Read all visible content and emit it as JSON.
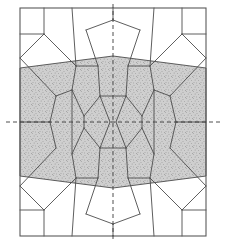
{
  "figure": {
    "title": "",
    "caption": "",
    "type": "cellular-tessellation-diagram",
    "background_color": "#ffffff",
    "line_color": "#4c4c4c",
    "frame_color": "#595959",
    "shade_fill": "#cfcfcf",
    "speckle_color": "#6e6e6e",
    "axis_color": "#3a3a3a",
    "line_width": 0.9,
    "frame_width": 1.1,
    "canvas": {
      "width": 226,
      "height": 252
    }
  },
  "frame": {
    "label": "outer-rectangle",
    "x0": 20,
    "y0": 8,
    "x1": 206,
    "y1": 236
  },
  "symmetry_axes": {
    "vertical": {
      "label": "vertical-mirror-axis",
      "x": 113,
      "y0": 4,
      "y1": 242,
      "dash": "4 3"
    },
    "horizontal": {
      "label": "horizontal-mirror-axis",
      "y": 122,
      "x0": 6,
      "x1": 220,
      "dash": "4 3"
    }
  },
  "shaded_band": {
    "label": "stippled-band",
    "top_edge": [
      [
        20,
        68
      ],
      [
        113,
        56
      ],
      [
        206,
        68
      ]
    ],
    "bottom_edge": [
      [
        206,
        176
      ],
      [
        113,
        188
      ],
      [
        20,
        176
      ]
    ],
    "fill": "#cfcfcf",
    "speckle_density": 0.33
  },
  "cell_edges": [
    {
      "name": "top-frame-vertex-left",
      "points": [
        [
          20,
          34
        ],
        [
          44,
          34
        ]
      ]
    },
    {
      "name": "top-stub-left",
      "points": [
        [
          44,
          8
        ],
        [
          44,
          34
        ]
      ]
    },
    {
      "name": "top-cell-left-diag",
      "points": [
        [
          44,
          34
        ],
        [
          76,
          66
        ]
      ]
    },
    {
      "name": "top-left-to-trapezoid",
      "points": [
        [
          76,
          66
        ],
        [
          72,
          8
        ]
      ]
    },
    {
      "name": "top-left-small-lower",
      "points": [
        [
          20,
          58
        ],
        [
          44,
          34
        ]
      ]
    },
    {
      "name": "left-upper-cell",
      "points": [
        [
          20,
          58
        ],
        [
          56,
          96
        ]
      ]
    },
    {
      "name": "node-top-left-a",
      "points": [
        [
          76,
          66
        ],
        [
          98,
          66
        ]
      ]
    },
    {
      "name": "node-top-left-b",
      "points": [
        [
          76,
          66
        ],
        [
          72,
          90
        ]
      ]
    },
    {
      "name": "decagon-upper-left",
      "points": [
        [
          98,
          66
        ],
        [
          86,
          30
        ]
      ]
    },
    {
      "name": "decagon-top-left-edge",
      "points": [
        [
          86,
          30
        ],
        [
          113,
          20
        ]
      ]
    },
    {
      "name": "decagon-seam-top",
      "points": [
        [
          113,
          8
        ],
        [
          113,
          20
        ]
      ]
    },
    {
      "name": "decagon-upper-right",
      "points": [
        [
          128,
          66
        ],
        [
          140,
          30
        ]
      ]
    },
    {
      "name": "decagon-top-right-edge",
      "points": [
        [
          140,
          30
        ],
        [
          113,
          20
        ]
      ]
    },
    {
      "name": "node-top-right-a",
      "points": [
        [
          150,
          66
        ],
        [
          128,
          66
        ]
      ]
    },
    {
      "name": "node-top-right-b",
      "points": [
        [
          150,
          66
        ],
        [
          154,
          90
        ]
      ]
    },
    {
      "name": "top-right-to-trapezoid",
      "points": [
        [
          150,
          66
        ],
        [
          154,
          8
        ]
      ]
    },
    {
      "name": "top-cell-right-diag",
      "points": [
        [
          182,
          34
        ],
        [
          150,
          66
        ]
      ]
    },
    {
      "name": "top-stub-right",
      "points": [
        [
          182,
          8
        ],
        [
          182,
          34
        ]
      ]
    },
    {
      "name": "top-frame-vertex-right",
      "points": [
        [
          206,
          34
        ],
        [
          182,
          34
        ]
      ]
    },
    {
      "name": "top-right-small-lower",
      "points": [
        [
          206,
          58
        ],
        [
          182,
          34
        ]
      ]
    },
    {
      "name": "right-upper-cell",
      "points": [
        [
          206,
          58
        ],
        [
          170,
          96
        ]
      ]
    },
    {
      "name": "mid-left-pocket-top",
      "points": [
        [
          56,
          96
        ],
        [
          72,
          90
        ]
      ]
    },
    {
      "name": "mid-left-pocket-side",
      "points": [
        [
          56,
          96
        ],
        [
          50,
          122
        ]
      ]
    },
    {
      "name": "mid-left-frame-edge",
      "points": [
        [
          20,
          122
        ],
        [
          50,
          122
        ]
      ]
    },
    {
      "name": "mid-left-pocket-bot",
      "points": [
        [
          50,
          122
        ],
        [
          56,
          148
        ]
      ]
    },
    {
      "name": "left-lower-cell",
      "points": [
        [
          20,
          186
        ],
        [
          56,
          148
        ]
      ]
    },
    {
      "name": "mid-right-pocket-top",
      "points": [
        [
          170,
          96
        ],
        [
          154,
          90
        ]
      ]
    },
    {
      "name": "mid-right-pocket-side",
      "points": [
        [
          170,
          96
        ],
        [
          176,
          122
        ]
      ]
    },
    {
      "name": "mid-right-frame-edge",
      "points": [
        [
          206,
          122
        ],
        [
          176,
          122
        ]
      ]
    },
    {
      "name": "mid-right-pocket-bot",
      "points": [
        [
          176,
          122
        ],
        [
          170,
          148
        ]
      ]
    },
    {
      "name": "right-lower-cell",
      "points": [
        [
          206,
          186
        ],
        [
          170,
          148
        ]
      ]
    },
    {
      "name": "inner-left-upper",
      "points": [
        [
          72,
          90
        ],
        [
          84,
          116
        ]
      ]
    },
    {
      "name": "inner-left-lower",
      "points": [
        [
          72,
          154
        ],
        [
          84,
          128
        ]
      ]
    },
    {
      "name": "inner-left-side",
      "points": [
        [
          72,
          90
        ],
        [
          72,
          154
        ]
      ]
    },
    {
      "name": "inner-right-upper",
      "points": [
        [
          154,
          90
        ],
        [
          142,
          116
        ]
      ]
    },
    {
      "name": "inner-right-lower",
      "points": [
        [
          154,
          154
        ],
        [
          142,
          128
        ]
      ]
    },
    {
      "name": "inner-right-side",
      "points": [
        [
          154,
          90
        ],
        [
          154,
          154
        ]
      ]
    },
    {
      "name": "bowtie-top-bar",
      "points": [
        [
          100,
          96
        ],
        [
          126,
          96
        ]
      ]
    },
    {
      "name": "bowtie-top-left",
      "points": [
        [
          100,
          96
        ],
        [
          110,
          122
        ]
      ]
    },
    {
      "name": "bowtie-top-right",
      "points": [
        [
          126,
          96
        ],
        [
          116,
          122
        ]
      ]
    },
    {
      "name": "bowtie-bot-left",
      "points": [
        [
          110,
          122
        ],
        [
          100,
          148
        ]
      ]
    },
    {
      "name": "bowtie-bot-right",
      "points": [
        [
          116,
          122
        ],
        [
          126,
          148
        ]
      ]
    },
    {
      "name": "bowtie-bot-bar",
      "points": [
        [
          100,
          148
        ],
        [
          126,
          148
        ]
      ]
    },
    {
      "name": "center-left-octagon-tl",
      "points": [
        [
          100,
          96
        ],
        [
          84,
          116
        ]
      ]
    },
    {
      "name": "center-left-octagon-bl",
      "points": [
        [
          100,
          148
        ],
        [
          84,
          128
        ]
      ]
    },
    {
      "name": "center-left-octagon-sp",
      "points": [
        [
          84,
          116
        ],
        [
          84,
          128
        ]
      ]
    },
    {
      "name": "center-right-octagon-tr",
      "points": [
        [
          126,
          96
        ],
        [
          142,
          116
        ]
      ]
    },
    {
      "name": "center-right-octagon-br",
      "points": [
        [
          126,
          148
        ],
        [
          142,
          128
        ]
      ]
    },
    {
      "name": "center-right-octagon-sp",
      "points": [
        [
          142,
          116
        ],
        [
          142,
          128
        ]
      ]
    },
    {
      "name": "upper-left-oct-top",
      "points": [
        [
          98,
          66
        ],
        [
          100,
          96
        ]
      ]
    },
    {
      "name": "upper-right-oct-top",
      "points": [
        [
          128,
          66
        ],
        [
          126,
          96
        ]
      ]
    },
    {
      "name": "lower-left-oct-bot",
      "points": [
        [
          98,
          178
        ],
        [
          100,
          148
        ]
      ]
    },
    {
      "name": "lower-right-oct-bot",
      "points": [
        [
          128,
          178
        ],
        [
          126,
          148
        ]
      ]
    },
    {
      "name": "node-bot-left-a",
      "points": [
        [
          76,
          178
        ],
        [
          98,
          178
        ]
      ]
    },
    {
      "name": "node-bot-left-b",
      "points": [
        [
          76,
          178
        ],
        [
          72,
          154
        ]
      ]
    },
    {
      "name": "node-bot-right-a",
      "points": [
        [
          150,
          178
        ],
        [
          128,
          178
        ]
      ]
    },
    {
      "name": "node-bot-right-b",
      "points": [
        [
          150,
          178
        ],
        [
          154,
          154
        ]
      ]
    },
    {
      "name": "decagon-lower-left",
      "points": [
        [
          98,
          178
        ],
        [
          86,
          214
        ]
      ]
    },
    {
      "name": "decagon-bot-left-edge",
      "points": [
        [
          86,
          214
        ],
        [
          113,
          224
        ]
      ]
    },
    {
      "name": "decagon-seam-bot",
      "points": [
        [
          113,
          236
        ],
        [
          113,
          224
        ]
      ]
    },
    {
      "name": "decagon-lower-right",
      "points": [
        [
          128,
          178
        ],
        [
          140,
          214
        ]
      ]
    },
    {
      "name": "decagon-bot-right-edge",
      "points": [
        [
          140,
          214
        ],
        [
          113,
          224
        ]
      ]
    },
    {
      "name": "bot-cell-left-diag",
      "points": [
        [
          44,
          210
        ],
        [
          76,
          178
        ]
      ]
    },
    {
      "name": "bot-left-to-trapezoid",
      "points": [
        [
          76,
          178
        ],
        [
          72,
          236
        ]
      ]
    },
    {
      "name": "bot-frame-vertex-left",
      "points": [
        [
          20,
          210
        ],
        [
          44,
          210
        ]
      ]
    },
    {
      "name": "bot-stub-left",
      "points": [
        [
          44,
          236
        ],
        [
          44,
          210
        ]
      ]
    },
    {
      "name": "bot-left-small-upper",
      "points": [
        [
          20,
          186
        ],
        [
          44,
          210
        ]
      ]
    },
    {
      "name": "bot-cell-right-diag",
      "points": [
        [
          182,
          210
        ],
        [
          150,
          178
        ]
      ]
    },
    {
      "name": "bot-right-to-trapezoid",
      "points": [
        [
          150,
          178
        ],
        [
          154,
          236
        ]
      ]
    },
    {
      "name": "bot-frame-vertex-right",
      "points": [
        [
          206,
          210
        ],
        [
          182,
          210
        ]
      ]
    },
    {
      "name": "bot-stub-right",
      "points": [
        [
          182,
          236
        ],
        [
          182,
          210
        ]
      ]
    },
    {
      "name": "bot-right-small-upper",
      "points": [
        [
          206,
          186
        ],
        [
          182,
          210
        ]
      ]
    }
  ]
}
